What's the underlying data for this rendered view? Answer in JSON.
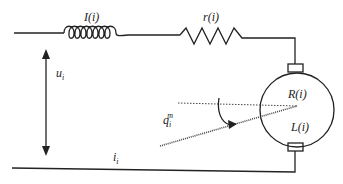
{
  "diagram": {
    "type": "dc-motor-equivalent-circuit",
    "colors": {
      "line": "#222222",
      "background": "#ffffff"
    },
    "components": {
      "inductor": {
        "label": "I(i)"
      },
      "resistor": {
        "label": "r(i)"
      },
      "motor": {
        "resistance_label": "R(i)",
        "inductance_label": "L(i)"
      }
    },
    "voltage": {
      "symbol": "u",
      "subscript": "i"
    },
    "current": {
      "symbol": "i",
      "subscript": "i"
    },
    "angle": {
      "symbol": "q",
      "subscript": "i",
      "superscript": "m"
    }
  }
}
